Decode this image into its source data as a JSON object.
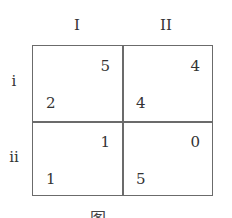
{
  "payoff_matrix": {
    "column_player_strategies": [
      "I",
      "II"
    ],
    "row_player_strategies": [
      "i",
      "ii"
    ],
    "cells": [
      [
        {
          "row_payoff": "2",
          "col_payoff": "5"
        },
        {
          "row_payoff": "4",
          "col_payoff": "4"
        }
      ],
      [
        {
          "row_payoff": "1",
          "col_payoff": "1"
        },
        {
          "row_payoff": "5",
          "col_payoff": "0"
        }
      ]
    ]
  },
  "caption": "图"
}
